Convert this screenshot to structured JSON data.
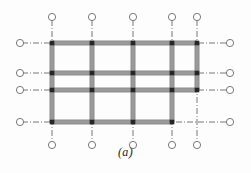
{
  "figure": {
    "caption": "(a)",
    "caption_y": 146,
    "width": 251,
    "height": 173,
    "background_color": "#fdfdfd"
  },
  "style": {
    "member_color": "#9a9a9a",
    "member_edge_color": "#6f6f6f",
    "joint_color": "#262626",
    "centerline_color": "#555555",
    "bubble_stroke": "#6a6a6a",
    "bubble_fill": "#ffffff",
    "member_thickness": 4.2,
    "centerline_width": 0.8,
    "bubble_radius": 3.6,
    "joint_size": 4.6,
    "dash_pattern": "6 2 1 2"
  },
  "grid": {
    "column_lines": [
      {
        "name": "column-line-1",
        "x": 52
      },
      {
        "name": "column-line-2",
        "x": 92
      },
      {
        "name": "column-line-3",
        "x": 133
      },
      {
        "name": "column-line-4",
        "x": 172
      },
      {
        "name": "column-line-5",
        "x": 197
      }
    ],
    "row_lines": [
      {
        "name": "beam-line-A",
        "y": 43
      },
      {
        "name": "beam-line-B",
        "y": 73
      },
      {
        "name": "beam-line-C",
        "y": 90
      },
      {
        "name": "beam-line-D",
        "y": 122
      }
    ],
    "centerline_extent": {
      "top": 20,
      "bottom": 142,
      "left": 22,
      "right": 228
    },
    "bubbles": {
      "top_y": 17,
      "bottom_y": 145,
      "left_x": 20,
      "right_x": 230
    }
  },
  "members": {
    "beams": [
      {
        "name": "beam-row-A",
        "row": 0,
        "from_col": 0,
        "to_col": 4
      },
      {
        "name": "beam-row-B",
        "row": 1,
        "from_col": 0,
        "to_col": 4
      },
      {
        "name": "beam-row-C",
        "row": 2,
        "from_col": 0,
        "to_col": 4
      },
      {
        "name": "beam-row-D",
        "row": 3,
        "from_col": 0,
        "to_col": 3
      }
    ],
    "columns": [
      {
        "name": "column-line-1-member",
        "col": 0,
        "from_row": 0,
        "to_row": 3
      },
      {
        "name": "column-line-2-member",
        "col": 1,
        "from_row": 0,
        "to_row": 3
      },
      {
        "name": "column-line-3-member",
        "col": 2,
        "from_row": 0,
        "to_row": 3
      },
      {
        "name": "column-line-4-member",
        "col": 3,
        "from_row": 0,
        "to_row": 3
      },
      {
        "name": "column-line-5-member",
        "col": 4,
        "from_row": 0,
        "to_row": 2
      }
    ],
    "joints": [
      {
        "col": 0,
        "row": 0
      },
      {
        "col": 1,
        "row": 0
      },
      {
        "col": 2,
        "row": 0
      },
      {
        "col": 3,
        "row": 0
      },
      {
        "col": 4,
        "row": 0
      },
      {
        "col": 0,
        "row": 1
      },
      {
        "col": 1,
        "row": 1
      },
      {
        "col": 2,
        "row": 1
      },
      {
        "col": 3,
        "row": 1
      },
      {
        "col": 4,
        "row": 1
      },
      {
        "col": 0,
        "row": 2
      },
      {
        "col": 1,
        "row": 2
      },
      {
        "col": 2,
        "row": 2
      },
      {
        "col": 3,
        "row": 2
      },
      {
        "col": 4,
        "row": 2
      },
      {
        "col": 0,
        "row": 3
      },
      {
        "col": 1,
        "row": 3
      },
      {
        "col": 2,
        "row": 3
      },
      {
        "col": 3,
        "row": 3
      }
    ]
  }
}
